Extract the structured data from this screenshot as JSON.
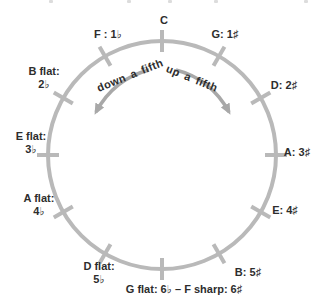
{
  "diagram": {
    "notes": {
      "c": "C",
      "g": "G: 1♯",
      "d": "D: 2♯",
      "a": "A: 3♯",
      "e": "E: 4♯",
      "b": "B: 5♯",
      "g_flat_f_sharp": "G flat: 6♭ – F sharp: 6♯",
      "d_flat": [
        "D flat:",
        "5♭"
      ],
      "a_flat": [
        "A flat:",
        "4♭"
      ],
      "e_flat": [
        "E flat:",
        "3♭"
      ],
      "b_flat": [
        "B flat:",
        "2♭"
      ],
      "f": "F : 1♭"
    },
    "arrows": {
      "left_label": "down a fifth",
      "right_label": "up a fifth"
    },
    "colors": {
      "circle": "#b9b9b9",
      "arrow": "#a8a8a8",
      "text": "#2d2d2d"
    }
  }
}
